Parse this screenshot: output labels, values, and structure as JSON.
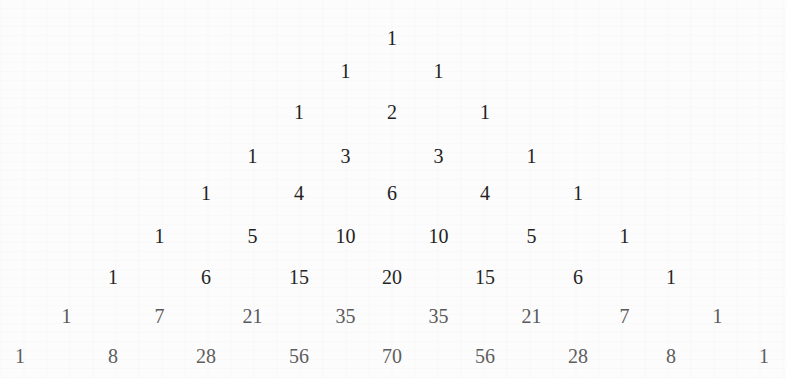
{
  "rows": [
    [
      1
    ],
    [
      1,
      1
    ],
    [
      1,
      2,
      1
    ],
    [
      1,
      3,
      3,
      1
    ],
    [
      1,
      4,
      6,
      4,
      1
    ],
    [
      1,
      5,
      10,
      10,
      5,
      1
    ],
    [
      1,
      6,
      15,
      20,
      15,
      6,
      1
    ],
    [
      1,
      7,
      21,
      35,
      35,
      21,
      7,
      1
    ],
    [
      1,
      8,
      28,
      56,
      70,
      56,
      28,
      8,
      1
    ]
  ],
  "layout": {
    "center_x": 392,
    "half_step_x": 46.5,
    "row_baselines_y": [
      44,
      77,
      118,
      162,
      199,
      242,
      283,
      322,
      362
    ]
  },
  "colors": {
    "background": "#fcfcfc",
    "row_text": [
      "#1e1e1e",
      "#1e1e1e",
      "#1e1e1e",
      "#222222",
      "#222222",
      "#222222",
      "#262626",
      "#5a5a5a",
      "#5e5e5e"
    ]
  }
}
